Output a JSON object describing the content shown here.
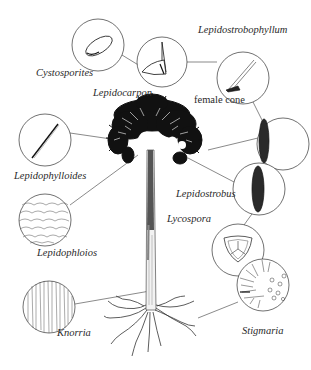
{
  "diagram": {
    "colors": {
      "ink": "#1a1a1a",
      "line": "#3a3a3a",
      "background": "#ffffff"
    },
    "labels": [
      {
        "id": "cystosporites",
        "text": "Cystosporites",
        "italic": true
      },
      {
        "id": "lepidocarpon",
        "text": "Lepidocarpon",
        "italic": true
      },
      {
        "id": "lepidostrobophyllum",
        "text": "Lepidostrobophyllum",
        "italic": true
      },
      {
        "id": "female_cone",
        "text": "female cone",
        "italic": false
      },
      {
        "id": "lepidophylloides",
        "text": "Lepidophylloides",
        "italic": true
      },
      {
        "id": "lepidostrobus",
        "text": "Lepidostrobus",
        "italic": true
      },
      {
        "id": "lycospora",
        "text": "Lycospora",
        "italic": true
      },
      {
        "id": "lepidophloios",
        "text": "Lepidophloios",
        "italic": true
      },
      {
        "id": "knorria",
        "text": "Knorria",
        "italic": true
      },
      {
        "id": "stigmaria",
        "text": "Stigmaria",
        "italic": true
      }
    ]
  }
}
